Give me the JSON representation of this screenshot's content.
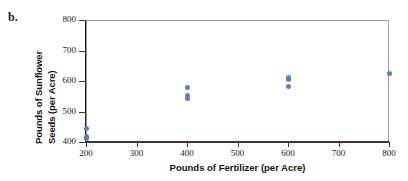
{
  "panel": {
    "letter": "b."
  },
  "chart_data": {
    "type": "scatter",
    "title": "",
    "xlabel": "Pounds of Fertilizer (per Acre)",
    "ylabel": "Pounds of Sunflower Seeds (per Acre)",
    "ylabel_line1": "Pounds of Sunflower",
    "ylabel_line2": "Seeds (per Acre)",
    "xlim": [
      200,
      800
    ],
    "ylim": [
      400,
      800
    ],
    "xticks": [
      200,
      300,
      400,
      500,
      600,
      700,
      800
    ],
    "yticks": [
      400,
      500,
      600,
      700,
      800
    ],
    "xtick_labels": [
      "200",
      "300",
      "400",
      "500",
      "600",
      "700",
      "800"
    ],
    "ytick_labels": [
      "400",
      "500",
      "600",
      "700",
      "800"
    ],
    "grid": false,
    "legend": false,
    "marker_color": "#5a7fc4",
    "axis_color": "#4a2f33",
    "frame_color": "#9a9a9a",
    "points": [
      {
        "x": 200,
        "y": 410
      },
      {
        "x": 200,
        "y": 418
      },
      {
        "x": 200,
        "y": 445
      },
      {
        "x": 400,
        "y": 543
      },
      {
        "x": 400,
        "y": 552
      },
      {
        "x": 400,
        "y": 580
      },
      {
        "x": 600,
        "y": 583
      },
      {
        "x": 600,
        "y": 605
      },
      {
        "x": 600,
        "y": 612
      },
      {
        "x": 800,
        "y": 625
      }
    ]
  }
}
